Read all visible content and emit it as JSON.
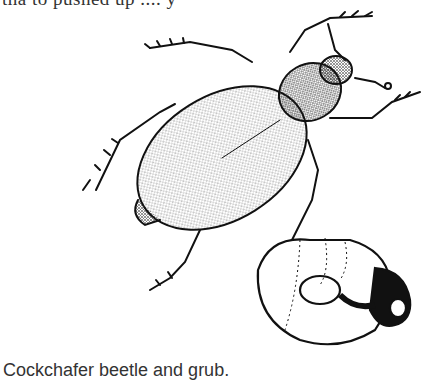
{
  "page": {
    "partial_top_text": "tha  to pushed up  ....        y",
    "figure": {
      "subjects": [
        "beetle",
        "grub"
      ],
      "caption": "Cockchafer beetle and grub."
    }
  }
}
